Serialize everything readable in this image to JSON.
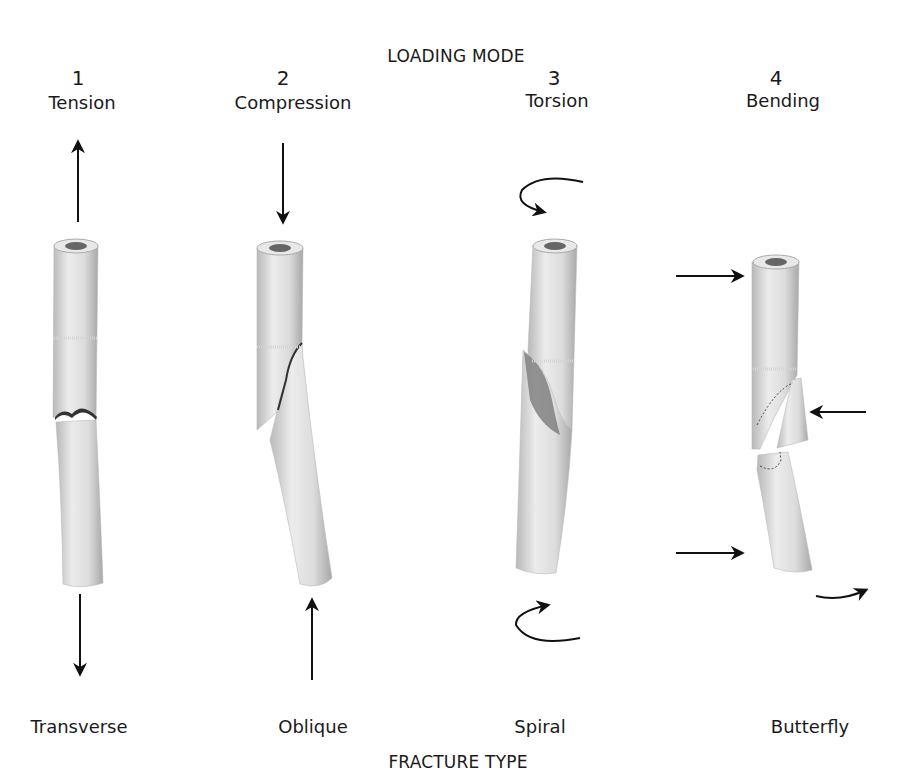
{
  "diagram": {
    "top_heading": "LOADING MODE",
    "bottom_heading": "FRACTURE TYPE",
    "columns": [
      {
        "number": "1",
        "loading_mode": "Tension",
        "fracture_type": "Transverse",
        "force_icons": [
          "arrow-up-icon",
          "arrow-down-icon"
        ]
      },
      {
        "number": "2",
        "loading_mode": "Compression",
        "fracture_type": "Oblique",
        "force_icons": [
          "arrow-down-icon",
          "arrow-up-icon"
        ]
      },
      {
        "number": "3",
        "loading_mode": "Torsion",
        "fracture_type": "Spiral",
        "force_icons": [
          "rotate-arrow-icon",
          "rotate-arrow-icon"
        ]
      },
      {
        "number": "4",
        "loading_mode": "Bending",
        "fracture_type": "Butterfly",
        "force_icons": [
          "arrow-right-icon",
          "arrow-left-icon",
          "arrow-right-icon",
          "curved-arrow-icon"
        ]
      }
    ]
  },
  "colors": {
    "bone_light": "#e6e6e6",
    "bone_mid": "#c8c8c8",
    "bone_dark": "#8a8a8a",
    "ink": "#111111"
  }
}
